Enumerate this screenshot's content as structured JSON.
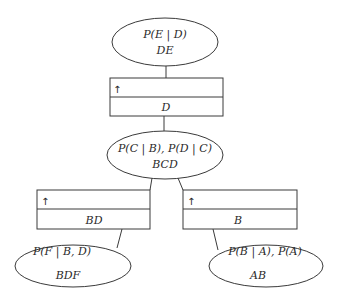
{
  "diagram": {
    "type": "junction-tree",
    "cliques": [
      {
        "id": "de",
        "potential": "P(E | D)",
        "variables": "DE"
      },
      {
        "id": "bcd",
        "potential": "P(C | B), P(D | C)",
        "variables": "BCD"
      },
      {
        "id": "bdf",
        "potential": "P(F | B, D)",
        "variables": "BDF"
      },
      {
        "id": "ab",
        "potential": "P(B | A), P(A)",
        "variables": "AB"
      }
    ],
    "separators": [
      {
        "id": "d",
        "message": "↑",
        "variables": "D"
      },
      {
        "id": "bd",
        "message": "↑",
        "variables": "BD"
      },
      {
        "id": "b",
        "message": "↑",
        "variables": "B"
      }
    ],
    "edges": [
      [
        "de",
        "d"
      ],
      [
        "d",
        "bcd"
      ],
      [
        "bcd",
        "bd"
      ],
      [
        "bd",
        "bdf"
      ],
      [
        "bcd",
        "b"
      ],
      [
        "b",
        "ab"
      ]
    ]
  }
}
